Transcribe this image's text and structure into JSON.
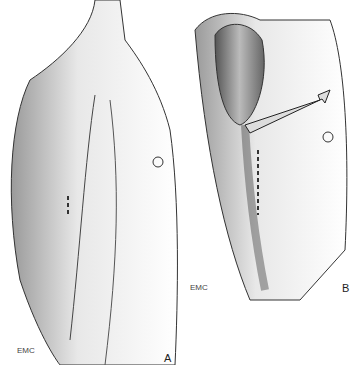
{
  "figure": {
    "panels": [
      {
        "label": "A",
        "signature": "EMC",
        "description": "Lateral view of male torso and upper arm with dashed incision line on upper arm"
      },
      {
        "label": "B",
        "signature": "EMC",
        "description": "Dissected upper arm showing muscles with retractor arrow and dashed incision line"
      }
    ]
  }
}
